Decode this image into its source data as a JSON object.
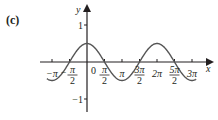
{
  "panel_label": "(c)",
  "axes": {
    "x_label": "x",
    "y_label": "y",
    "y_ticks": [
      {
        "value": 1,
        "label": "1"
      },
      {
        "value": -1,
        "label": "−1"
      }
    ],
    "origin_label": "0",
    "x_ticks": [
      {
        "value": -3.14159,
        "num": "−π",
        "den": ""
      },
      {
        "value": -1.5708,
        "num": "−π",
        "den": "2"
      },
      {
        "value": 1.5708,
        "num": "π",
        "den": "2"
      },
      {
        "value": 3.14159,
        "num": "π",
        "den": ""
      },
      {
        "value": 4.71239,
        "num": "3π",
        "den": "2"
      },
      {
        "value": 6.28319,
        "num": "2π",
        "den": ""
      },
      {
        "value": 7.85398,
        "num": "5π",
        "den": "2"
      },
      {
        "value": 9.42478,
        "num": "3π",
        "den": ""
      }
    ]
  },
  "colors": {
    "curve": "#555555",
    "axis": "#231f20"
  },
  "chart_data": {
    "type": "line",
    "title": "",
    "panel": "(c)",
    "xlabel": "x",
    "ylabel": "y",
    "function": "y = 0.5 cos(x)",
    "xlim": [
      -3.6,
      10.0
    ],
    "ylim": [
      -1.2,
      1.3
    ],
    "x_tick_labels": [
      "-π",
      "-π/2",
      "0",
      "π/2",
      "π",
      "3π/2",
      "2π",
      "5π/2",
      "3π"
    ],
    "y_tick_labels": [
      "1",
      "-1"
    ],
    "grid": false,
    "series": [
      {
        "name": "y = 0.5cos x",
        "x": [
          -3.14159,
          -1.5708,
          0,
          1.5708,
          3.14159,
          4.71239,
          6.28319,
          7.85398,
          9.42478
        ],
        "y": [
          -0.5,
          0,
          0.5,
          0,
          -0.5,
          0,
          0.5,
          0,
          -0.5
        ]
      }
    ]
  }
}
